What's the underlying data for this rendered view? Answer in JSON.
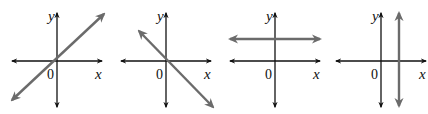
{
  "figure": {
    "axis_labels": {
      "x": "x",
      "y": "y",
      "origin": "0"
    },
    "colors": {
      "axis": "#111111",
      "line": "#6b6b6b",
      "background": "#ffffff"
    },
    "panels": [
      {
        "name": "positive-slope",
        "axis_x": 57,
        "axis_y": 61,
        "line": {
          "x1": 12,
          "y1": 100,
          "x2": 104,
          "y2": 14
        }
      },
      {
        "name": "negative-slope",
        "axis_x": 166,
        "axis_y": 61,
        "line": {
          "x1": 139,
          "y1": 31,
          "x2": 213,
          "y2": 107
        }
      },
      {
        "name": "horizontal-line",
        "axis_x": 275,
        "axis_y": 61,
        "line": {
          "x1": 230,
          "y1": 39,
          "x2": 320,
          "y2": 39
        }
      },
      {
        "name": "vertical-line",
        "axis_x": 381,
        "axis_y": 61,
        "line": {
          "x1": 399,
          "y1": 13,
          "x2": 399,
          "y2": 106
        }
      }
    ]
  }
}
